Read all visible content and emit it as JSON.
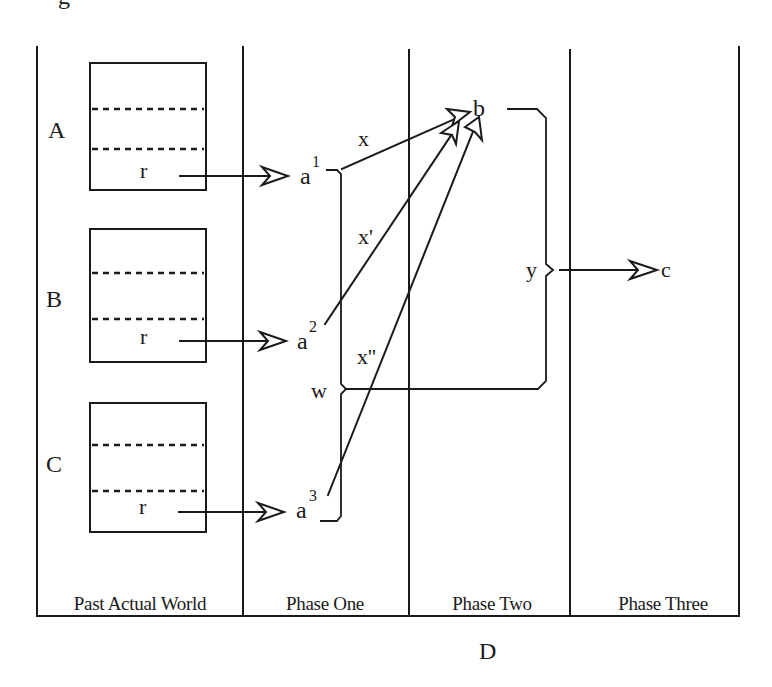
{
  "figure": {
    "top_fragment": "g",
    "footer_label": "D"
  },
  "columns": [
    {
      "label": "Past Actual World"
    },
    {
      "label": "Phase One"
    },
    {
      "label": "Phase Two"
    },
    {
      "label": "Phase Three"
    }
  ],
  "worlds": [
    {
      "label": "A",
      "record": "r"
    },
    {
      "label": "B",
      "record": "r"
    },
    {
      "label": "C",
      "record": "r"
    }
  ],
  "phase_one": {
    "nodes": [
      {
        "base": "a",
        "sup": "1"
      },
      {
        "base": "a",
        "sup": "2"
      },
      {
        "base": "a",
        "sup": "3"
      }
    ],
    "brace_label": "w"
  },
  "links": [
    {
      "label": "x"
    },
    {
      "label": "x'"
    },
    {
      "label": "x''"
    }
  ],
  "phase_two": {
    "node": "b",
    "brace_label": "y"
  },
  "phase_three": {
    "node": "c"
  },
  "colors": {
    "ink": "#1a1a1a",
    "background": "#ffffff"
  }
}
